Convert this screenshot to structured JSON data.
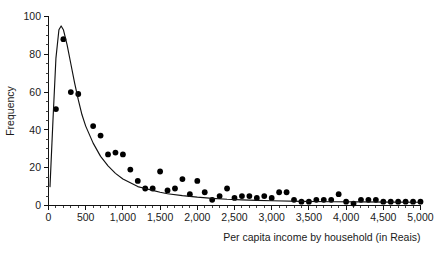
{
  "chart_data": {
    "type": "scatter",
    "title": "",
    "subtitle": "",
    "xlabel": "Per capita income by household (in Reais)",
    "ylabel": "Frequency",
    "xlim": [
      0,
      5000
    ],
    "ylim": [
      0,
      100
    ],
    "x_ticks": [
      0,
      500,
      1000,
      1500,
      2000,
      2500,
      3000,
      3500,
      4000,
      4500,
      5000
    ],
    "x_tick_labels": [
      "0",
      "500",
      "1,000",
      "1,500",
      "2,000",
      "2,500",
      "3,000",
      "3,500",
      "4,000",
      "4,500",
      "5,000"
    ],
    "y_ticks": [
      0,
      20,
      40,
      60,
      80,
      100
    ],
    "y_tick_labels": [
      "0",
      "20",
      "40",
      "60",
      "80",
      "100"
    ],
    "x_minor_tick_step": 100,
    "y_minor_tick_step": 5,
    "grid": false,
    "legend": null,
    "legend_position": "none",
    "marker": "filled-circle",
    "marker_color": "#000000",
    "curve_color": "#111111",
    "series": [
      {
        "name": "Observed frequency",
        "type": "scatter",
        "points": [
          [
            100,
            51
          ],
          [
            200,
            88
          ],
          [
            300,
            60
          ],
          [
            400,
            59
          ],
          [
            600,
            42
          ],
          [
            700,
            37
          ],
          [
            800,
            27
          ],
          [
            900,
            28
          ],
          [
            1000,
            27
          ],
          [
            1100,
            19
          ],
          [
            1200,
            13
          ],
          [
            1300,
            9
          ],
          [
            1400,
            9
          ],
          [
            1500,
            18
          ],
          [
            1600,
            8
          ],
          [
            1700,
            9
          ],
          [
            1800,
            14
          ],
          [
            1900,
            6
          ],
          [
            2000,
            13
          ],
          [
            2100,
            7
          ],
          [
            2200,
            3
          ],
          [
            2300,
            5
          ],
          [
            2400,
            9
          ],
          [
            2500,
            4
          ],
          [
            2600,
            5
          ],
          [
            2700,
            5
          ],
          [
            2800,
            4
          ],
          [
            2900,
            5
          ],
          [
            3000,
            4
          ],
          [
            3100,
            7
          ],
          [
            3200,
            7
          ],
          [
            3300,
            3
          ],
          [
            3400,
            2
          ],
          [
            3500,
            2
          ],
          [
            3600,
            3
          ],
          [
            3700,
            3
          ],
          [
            3800,
            3
          ],
          [
            3900,
            6
          ],
          [
            4000,
            2
          ],
          [
            4100,
            1
          ],
          [
            4200,
            3
          ],
          [
            4300,
            3
          ],
          [
            4400,
            3
          ],
          [
            4500,
            2
          ],
          [
            4600,
            2
          ],
          [
            4700,
            2
          ],
          [
            4800,
            2
          ],
          [
            4900,
            2
          ],
          [
            5000,
            2
          ]
        ]
      },
      {
        "name": "Fitted distribution curve",
        "type": "line",
        "points": [
          [
            20,
            10
          ],
          [
            60,
            45
          ],
          [
            100,
            78
          ],
          [
            140,
            93
          ],
          [
            170,
            95
          ],
          [
            200,
            93
          ],
          [
            250,
            85
          ],
          [
            300,
            75
          ],
          [
            350,
            65
          ],
          [
            400,
            56
          ],
          [
            450,
            48
          ],
          [
            500,
            42
          ],
          [
            600,
            33
          ],
          [
            700,
            26
          ],
          [
            800,
            21
          ],
          [
            900,
            17
          ],
          [
            1000,
            14
          ],
          [
            1100,
            12
          ],
          [
            1200,
            10
          ],
          [
            1300,
            9
          ],
          [
            1400,
            8
          ],
          [
            1500,
            7
          ],
          [
            1600,
            6.2
          ],
          [
            1800,
            5.2
          ],
          [
            2000,
            4.4
          ],
          [
            2200,
            3.8
          ],
          [
            2400,
            3.3
          ],
          [
            2600,
            3.0
          ],
          [
            2800,
            2.7
          ],
          [
            3000,
            2.5
          ],
          [
            3400,
            2.2
          ],
          [
            3800,
            2.0
          ],
          [
            4200,
            1.9
          ],
          [
            4600,
            1.8
          ],
          [
            5000,
            1.7
          ]
        ]
      }
    ]
  }
}
